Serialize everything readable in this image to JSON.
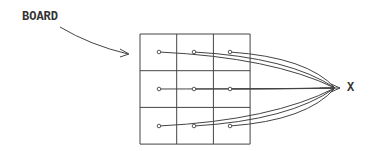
{
  "labels": {
    "board": "BOARD",
    "target": "X"
  },
  "grid": {
    "rows": 3,
    "cols": 3,
    "x": 140,
    "y": 34,
    "cell": 36.7
  },
  "points": [
    {
      "x": 159,
      "y": 52
    },
    {
      "x": 194,
      "y": 52
    },
    {
      "x": 230,
      "y": 52
    },
    {
      "x": 159,
      "y": 89
    },
    {
      "x": 194,
      "y": 89
    },
    {
      "x": 230,
      "y": 89
    },
    {
      "x": 159,
      "y": 126
    },
    {
      "x": 194,
      "y": 126
    },
    {
      "x": 230,
      "y": 126
    }
  ],
  "convergence": {
    "x": 335,
    "y": 88
  },
  "colors": {
    "ink": "#333333"
  }
}
